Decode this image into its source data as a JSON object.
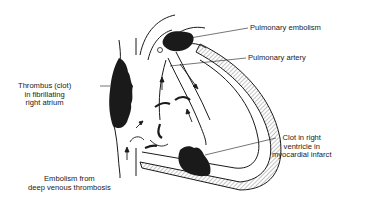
{
  "diagram": {
    "labels": {
      "pulmonary_embolism": "Pulmonary embolism",
      "pulmonary_artery": "Pulmonary artery",
      "thrombus": [
        "Thrombus (clot)",
        "in fibrillating",
        "right atrium"
      ],
      "clot_ventricle": [
        "Clot in right",
        "ventricle in",
        "myocardial infarct"
      ],
      "embolism_dvt": [
        "Embolism from",
        "deep venous thrombosis"
      ]
    },
    "colors": {
      "ink": "#1a1a1a",
      "background": "#ffffff",
      "hatch": "#8a8a8a"
    }
  }
}
